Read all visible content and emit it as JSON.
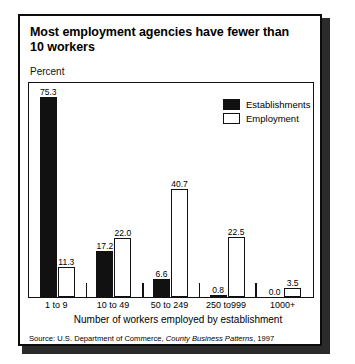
{
  "figure": {
    "title_line1": "Most employment agencies have fewer than",
    "title_line2": "10 workers",
    "unit_label": "Percent",
    "source_prefix": "Source: U.S. Department of Commerce, ",
    "source_italic": "County Business Patterns",
    "source_suffix": ", 1997"
  },
  "chart_data": {
    "type": "bar",
    "title": "Most employment agencies have fewer than 10 workers",
    "subtitle": "",
    "xlabel": "Number of workers employed by establishment",
    "ylabel": "Percent",
    "ylim": [
      0,
      80
    ],
    "grid": false,
    "legend_position": "inside-top-right",
    "categories": [
      "1 to 9",
      "10 to 49",
      "50 to 249",
      "250 to999",
      "1000+"
    ],
    "series": [
      {
        "name": "Establishments",
        "color": "#111111",
        "style": "filled",
        "values": [
          75.3,
          17.2,
          6.6,
          0.8,
          0.0
        ],
        "labels": [
          "75.3",
          "17.2",
          "6.6",
          "0.8",
          "0.0"
        ]
      },
      {
        "name": "Employment",
        "color": "#ffffff",
        "style": "outlined",
        "values": [
          11.3,
          22.0,
          40.7,
          22.5,
          3.5
        ],
        "labels": [
          "11.3",
          "22.0",
          "40.7",
          "22.5",
          "3.5"
        ]
      }
    ],
    "annotations": [
      "Source: U.S. Department of Commerce, County Business Patterns, 1997"
    ]
  }
}
